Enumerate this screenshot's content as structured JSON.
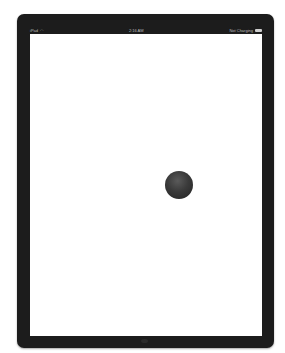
{
  "statusbar": {
    "carrier": "iPad",
    "wifi_icon": "wifi-icon",
    "time": "2:16 AM",
    "battery_status": "Not Charging",
    "battery_icon": "battery-icon"
  },
  "screen": {
    "background": "#ffffff",
    "ball": {
      "color": "#3a3a3a",
      "icon": "ball"
    }
  },
  "device": {
    "frame_color": "#1c1c1c"
  }
}
